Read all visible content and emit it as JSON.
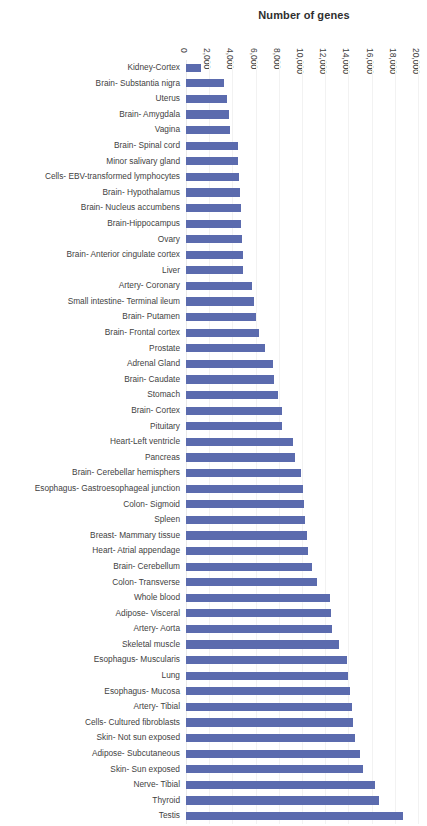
{
  "chart_data": {
    "type": "bar",
    "orientation": "horizontal",
    "title": "Number of genes",
    "xlabel": "Number of genes",
    "ylabel": "",
    "xlim": [
      0,
      20000
    ],
    "xticks": [
      "0",
      "2,000",
      "4,000",
      "6,000",
      "8,000",
      "10,000",
      "12,000",
      "14,000",
      "16,000",
      "18,000",
      "20,000"
    ],
    "xtick_values": [
      0,
      2000,
      4000,
      6000,
      8000,
      10000,
      12000,
      14000,
      16000,
      18000,
      20000
    ],
    "grid": true,
    "legend": "none",
    "series_color": "#5b6bae",
    "categories": [
      "Kidney-Cortex",
      "Brain- Substantia nigra",
      "Uterus",
      "Brain- Amygdala",
      "Vagina",
      "Brain- Spinal cord",
      "Minor salivary gland",
      "Cells- EBV-transformed lymphocytes",
      "Brain- Hypothalamus",
      "Brain- Nucleus accumbens",
      "Brain-Hippocampus",
      "Ovary",
      "Brain- Anterior cingulate cortex",
      "Liver",
      "Artery- Coronary",
      "Small intestine- Terminal ileum",
      "Brain- Putamen",
      "Brain- Frontal cortex",
      "Prostate",
      "Adrenal  Gland",
      "Brain- Caudate",
      "Stomach",
      "Brain- Cortex",
      "Pituitary",
      "Heart-Left ventricle",
      "Pancreas",
      "Brain- Cerebellar hemisphers",
      "Esophagus- Gastroesophageal junction",
      "Colon- Sigmoid",
      "Spleen",
      "Breast- Mammary tissue",
      "Heart- Atrial appendage",
      "Brain- Cerebellum",
      "Colon- Transverse",
      "Whole blood",
      "Adipose- Visceral",
      "Artery- Aorta",
      "Skeletal muscle",
      "Esophagus- Muscularis",
      "Lung",
      "Esophagus- Mucosa",
      "Artery- Tibial",
      "Cells- Cultured fibroblasts",
      "Skin- Not sun exposed",
      "Adipose- Subcutaneous",
      "Skin- Sun exposed",
      "Nerve- Tibial",
      "Thyroid",
      "Testis"
    ],
    "values": [
      1300,
      3300,
      3550,
      3700,
      3750,
      4450,
      4500,
      4600,
      4650,
      4700,
      4750,
      4850,
      4900,
      4950,
      5700,
      5900,
      6000,
      6300,
      6800,
      7500,
      7600,
      7900,
      8250,
      8300,
      9200,
      9400,
      9900,
      10100,
      10200,
      10250,
      10400,
      10500,
      10900,
      11300,
      12400,
      12500,
      12600,
      13200,
      13900,
      14000,
      14100,
      14300,
      14400,
      14600,
      15000,
      15300,
      16300,
      16600,
      18700
    ]
  }
}
